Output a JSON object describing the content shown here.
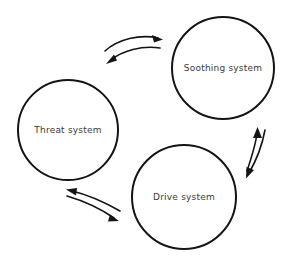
{
  "diagram": {
    "type": "cycle",
    "background_color": "#ffffff",
    "stroke_color": "#141414",
    "label_color": "#3a3a3a",
    "nodes": [
      {
        "id": "threat",
        "label": "Threat system",
        "cx": 68,
        "cy": 130,
        "r": 50
      },
      {
        "id": "soothing",
        "label": "Soothing system",
        "cx": 223,
        "cy": 68,
        "r": 51
      },
      {
        "id": "drive",
        "label": "Drive system",
        "cx": 184,
        "cy": 197,
        "r": 52
      }
    ],
    "connectors": [
      {
        "id": "threat-to-soothing",
        "from": "threat",
        "to": "soothing",
        "direction": "right"
      },
      {
        "id": "soothing-to-threat",
        "from": "soothing",
        "to": "threat",
        "direction": "left"
      },
      {
        "id": "drive-to-soothing",
        "from": "drive",
        "to": "soothing",
        "direction": "up"
      },
      {
        "id": "soothing-to-drive",
        "from": "soothing",
        "to": "drive",
        "direction": "down"
      },
      {
        "id": "drive-to-threat",
        "from": "drive",
        "to": "threat",
        "direction": "up-left"
      },
      {
        "id": "threat-to-drive",
        "from": "threat",
        "to": "drive",
        "direction": "down-right"
      }
    ]
  }
}
